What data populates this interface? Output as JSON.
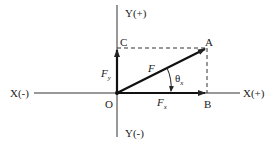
{
  "diagram": {
    "type": "vector-components",
    "colors": {
      "line": "#222222",
      "background": "#ffffff"
    },
    "axes": {
      "x_neg": "X(-)",
      "x_pos": "X(+)",
      "y_pos": "Y(+)",
      "y_neg": "Y(-)"
    },
    "points": {
      "origin": "O",
      "a": "A",
      "b": "B",
      "c": "C"
    },
    "vectors": {
      "f": {
        "symbol": "F"
      },
      "fx": {
        "symbol": "F",
        "subscript": "x"
      },
      "fy": {
        "symbol": "F",
        "subscript": "y"
      }
    },
    "angle": {
      "symbol": "θ",
      "subscript": "x"
    }
  }
}
